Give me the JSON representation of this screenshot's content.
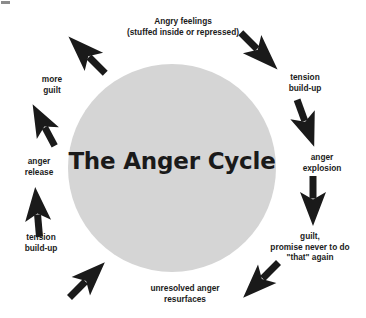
{
  "diagram": {
    "title": "The Anger Cycle",
    "type": "cycle-diagram",
    "background_color": "#ffffff",
    "circle_color": "#d5d5d5",
    "arrow_color": "#1a1a1a",
    "text_color": "#1b1b1b",
    "stages": [
      {
        "id": "angry-feelings",
        "position": "top",
        "lines": [
          "Angry feelings",
          "(stuffed inside or repressed)"
        ],
        "line1_bold_word": "Angry",
        "line1_rest": " feelings",
        "line2": "(stuffed inside or repressed)"
      },
      {
        "id": "tension-build-up-right",
        "position": "top-right",
        "lines": [
          "tension",
          "build-up"
        ]
      },
      {
        "id": "anger-explosion",
        "position": "right",
        "lines": [
          "anger",
          "explosion"
        ]
      },
      {
        "id": "guilt-promise",
        "position": "bottom-right",
        "lines": [
          "guilt,",
          "promise never to do",
          "\"that\" again"
        ]
      },
      {
        "id": "unresolved-anger",
        "position": "bottom",
        "lines": [
          "unresolved anger",
          "resurfaces"
        ]
      },
      {
        "id": "tension-build-up-left",
        "position": "bottom-left",
        "lines": [
          "tension",
          "build-up"
        ]
      },
      {
        "id": "anger-release",
        "position": "left",
        "lines": [
          "anger",
          "release"
        ]
      },
      {
        "id": "more-guilt",
        "position": "top-left",
        "lines": [
          "more",
          "guilt"
        ]
      }
    ],
    "arrows": [
      {
        "id": "arrow-top-left-up-right",
        "direction": "up-right",
        "name": "arrow-up-right-icon"
      },
      {
        "id": "arrow-top-right-down-right",
        "direction": "down-right",
        "name": "arrow-down-right-icon"
      },
      {
        "id": "arrow-right-upper-down",
        "direction": "down",
        "name": "arrow-down-icon"
      },
      {
        "id": "arrow-right-lower-down",
        "direction": "down",
        "name": "arrow-down-icon"
      },
      {
        "id": "arrow-bottom-right-down-left",
        "direction": "down-left",
        "name": "arrow-down-left-icon"
      },
      {
        "id": "arrow-bottom-left-up-left",
        "direction": "up-left",
        "name": "arrow-up-left-icon"
      },
      {
        "id": "arrow-left-lower-up",
        "direction": "up",
        "name": "arrow-up-icon"
      },
      {
        "id": "arrow-left-upper-up-right",
        "direction": "up-right",
        "name": "arrow-up-right-icon"
      }
    ]
  }
}
